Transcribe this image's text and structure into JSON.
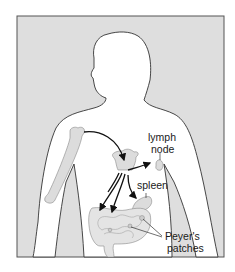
{
  "figure": {
    "type": "anatomical-diagram",
    "colors": {
      "background": "#ffffff",
      "frame_fill": "#dedede",
      "body_fill": "#ffffff",
      "organ_fill": "#dcdcdc",
      "outline": "#333333",
      "arrow": "#111111"
    }
  },
  "labels": {
    "lymph_node_line1": "lymph",
    "lymph_node_line2": "node",
    "spleen": "spleen",
    "peyers_line1": "Peyer's",
    "peyers_line2": "patches"
  }
}
